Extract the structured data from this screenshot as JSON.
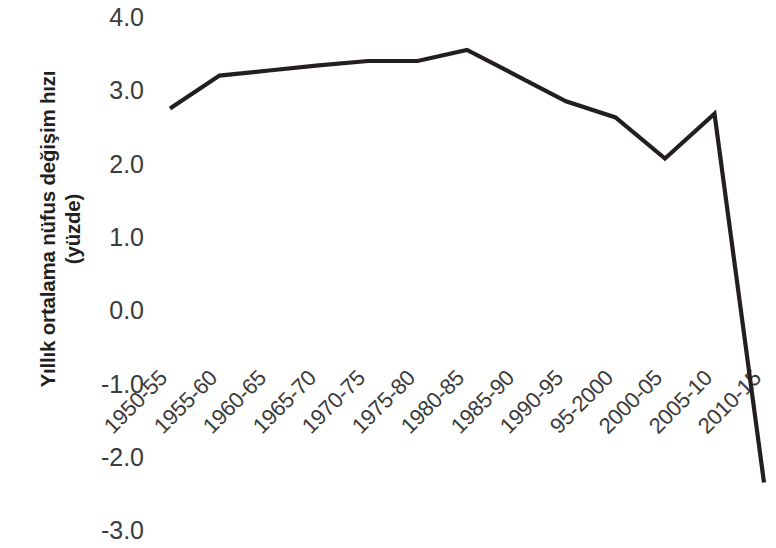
{
  "chart_data": {
    "type": "line",
    "title": "",
    "xlabel": "",
    "ylabel": "Yıllık ortalama nüfus değişim hızı (yüzde)",
    "ylabel_line1": "Yıllık ortalama nüfus değişim hızı",
    "ylabel_line2": "(yüzde)",
    "categories": [
      "1950-55",
      "1955-60",
      "1960-65",
      "1965-70",
      "1970-75",
      "1975-80",
      "1980-85",
      "1985-90",
      "1990-95",
      "95-2000",
      "2000-05",
      "2005-10",
      "2010-15"
    ],
    "values": [
      2.75,
      3.2,
      3.27,
      3.34,
      3.4,
      3.4,
      3.55,
      3.2,
      2.85,
      2.63,
      2.07,
      2.68,
      -2.35
    ],
    "ylim": [
      -3.0,
      4.0
    ],
    "y_ticks": [
      "4.0",
      "3.0",
      "2.0",
      "1.0",
      "0.0",
      "-1.0",
      "-2.0",
      "-3.0"
    ],
    "y_tick_values": [
      4.0,
      3.0,
      2.0,
      1.0,
      0.0,
      -1.0,
      -2.0,
      -3.0
    ],
    "grid": false,
    "legend": false,
    "legend_position": "none",
    "series_color": "#231f20",
    "line_width": 4.2,
    "x_tick_rotation": -45
  },
  "colors": {
    "background": "#ffffff",
    "text": "#3b3b3b",
    "axis_title": "#231f20",
    "series": "#231f20"
  }
}
